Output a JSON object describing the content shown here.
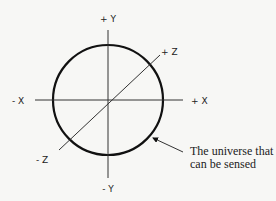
{
  "diagram": {
    "axes": {
      "plus_y": "+ Y",
      "minus_y": "- Y",
      "plus_x": "+ X",
      "minus_x": "- X",
      "plus_z": "+ Z",
      "minus_z": "- Z"
    },
    "annotation": {
      "line1": "The universe that",
      "line2": "can be sensed"
    },
    "colors": {
      "background": "#f7f7f5",
      "stroke": "#111111"
    }
  }
}
